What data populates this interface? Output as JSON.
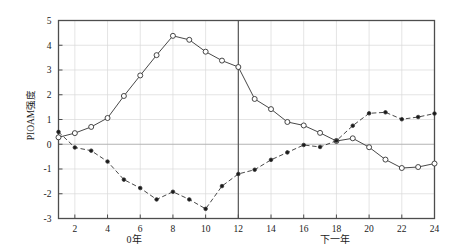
{
  "axes": {
    "ylabel": "PIOAM强度",
    "y_ticks": [
      "5",
      "4",
      "3",
      "2",
      "1",
      "0",
      "-1",
      "-2",
      "-3"
    ],
    "y_tick_values": [
      5,
      4,
      3,
      2,
      1,
      0,
      -1,
      -2,
      -3
    ],
    "x_ticks": [
      "2",
      "4",
      "6",
      "8",
      "10",
      "12",
      "14",
      "16",
      "18",
      "20",
      "22",
      "24"
    ],
    "x_tick_values": [
      2,
      4,
      6,
      8,
      10,
      12,
      14,
      16,
      18,
      20,
      22,
      24
    ],
    "section_label_left": "0年",
    "section_label_right": "下一年"
  },
  "colors": {
    "frame": "#4d4d4d",
    "line": "#333333",
    "gridline": "#d9d9d9",
    "zero_line": "#b3b3b3",
    "divider": "#555555",
    "marker_open_fill": "#ffffff",
    "marker_closed_fill": "#1a1a1a",
    "background": "#ffffff",
    "text": "#1a1a1a"
  },
  "chart_data": {
    "type": "line",
    "title": "",
    "xlabel": "",
    "ylabel": "PIOAM强度",
    "xlim": [
      1,
      24
    ],
    "ylim": [
      -3,
      5
    ],
    "grid": true,
    "legend_position": "none",
    "x": [
      1,
      2,
      3,
      4,
      5,
      6,
      7,
      8,
      9,
      10,
      11,
      12,
      13,
      14,
      15,
      16,
      17,
      18,
      19,
      20,
      21,
      22,
      23,
      24
    ],
    "annotations": [
      {
        "type": "vline",
        "x": 12,
        "label": ""
      },
      {
        "type": "hline",
        "y": 0,
        "label": ""
      },
      {
        "type": "text",
        "x": 6.5,
        "y": -3.6,
        "text": "0年"
      },
      {
        "type": "text",
        "x": 19.5,
        "y": -3.6,
        "text": "下一年"
      }
    ],
    "series": [
      {
        "name": "open-circle-series",
        "marker": "open-circle",
        "linestyle": "solid",
        "values": [
          0.28,
          0.45,
          0.7,
          1.06,
          1.95,
          2.78,
          3.6,
          4.38,
          4.22,
          3.74,
          3.38,
          3.12,
          1.83,
          1.42,
          0.9,
          0.76,
          0.46,
          0.13,
          0.24,
          -0.12,
          -0.62,
          -0.96,
          -0.92,
          -0.78
        ]
      },
      {
        "name": "filled-circle-series",
        "marker": "filled-circle",
        "linestyle": "dashed",
        "values": [
          0.5,
          -0.13,
          -0.26,
          -0.7,
          -1.43,
          -1.77,
          -2.23,
          -1.92,
          -2.23,
          -2.61,
          -1.69,
          -1.2,
          -1.03,
          -0.63,
          -0.33,
          -0.03,
          -0.11,
          0.14,
          0.75,
          1.25,
          1.29,
          1.01,
          1.1,
          1.24
        ]
      }
    ]
  }
}
